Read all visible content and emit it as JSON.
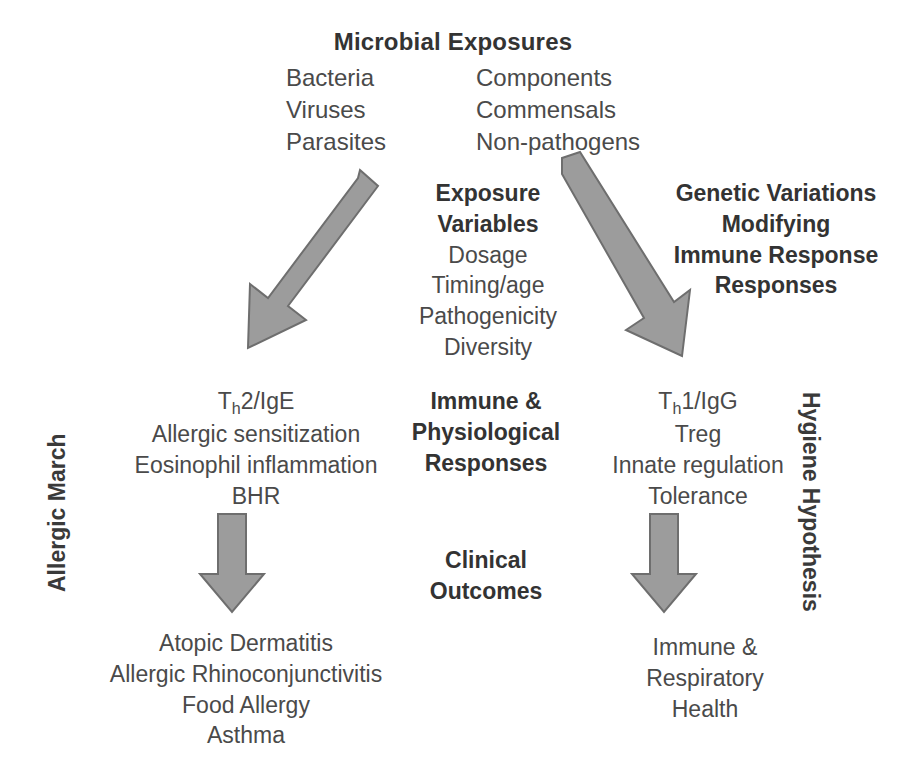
{
  "diagram": {
    "title": "Microbial Exposures",
    "colors": {
      "arrow_fill": "#9c9c9c",
      "arrow_stroke": "#6e6e6e",
      "text": "#4a4a4a",
      "heading_text": "#333333",
      "background": "#ffffff"
    },
    "top": {
      "heading": "Microbial Exposures",
      "column_left": [
        "Bacteria",
        "Viruses",
        "Parasites"
      ],
      "column_right": [
        "Components",
        "Commensals",
        "Non-pathogens"
      ]
    },
    "middle_left": {
      "heading_line1": "Exposure",
      "heading_line2": "Variables",
      "items": [
        "Dosage",
        "Timing/age",
        "Pathogenicity",
        "Diversity"
      ]
    },
    "middle_right": {
      "lines": [
        "Genetic Variations",
        "Modifying",
        "Immune Response",
        "Responses"
      ]
    },
    "response_left": {
      "label_prefix": "T",
      "label_sub": "h",
      "label_suffix": "2/IgE",
      "items": [
        "Allergic sensitization",
        "Eosinophil inflammation",
        "BHR"
      ]
    },
    "response_center": {
      "lines": [
        "Immune &",
        "Physiological",
        "Responses"
      ]
    },
    "response_right": {
      "label_prefix": "T",
      "label_sub": "h",
      "label_suffix": "1/IgG",
      "items": [
        "Treg",
        "Innate regulation",
        "Tolerance"
      ]
    },
    "outcomes_center": {
      "lines": [
        "Clinical",
        "Outcomes"
      ]
    },
    "outcomes_left": {
      "items": [
        "Atopic Dermatitis",
        "Allergic Rhinoconjunctivitis",
        "Food Allergy",
        "Asthma"
      ]
    },
    "outcomes_right": {
      "items": [
        "Immune &",
        "Respiratory",
        "Health"
      ]
    },
    "side_labels": {
      "left": "Allergic March",
      "right": "Hygiene Hypothesis"
    },
    "arrows": [
      {
        "name": "arrow-diagonal-down-left",
        "direction": "down-left"
      },
      {
        "name": "arrow-diagonal-down-right",
        "direction": "down-right"
      },
      {
        "name": "arrow-down-left-column",
        "direction": "down"
      },
      {
        "name": "arrow-down-right-column",
        "direction": "down"
      }
    ]
  }
}
